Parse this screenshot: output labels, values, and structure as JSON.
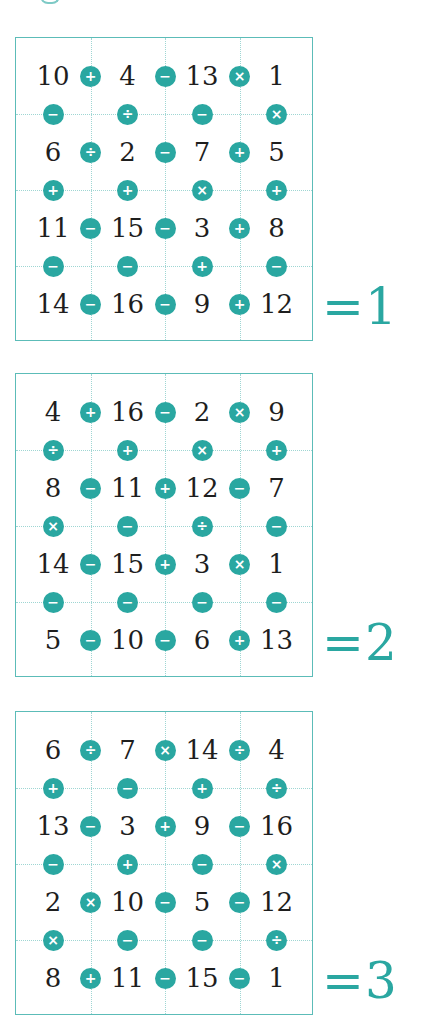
{
  "accent_color": "#2aa7a1",
  "puzzles": [
    {
      "result": "=1",
      "rows": [
        [
          "10",
          "4",
          "13",
          "1"
        ],
        [
          "6",
          "2",
          "7",
          "5"
        ],
        [
          "11",
          "15",
          "3",
          "8"
        ],
        [
          "14",
          "16",
          "9",
          "12"
        ]
      ],
      "h_ops": [
        [
          "+",
          "−",
          "×"
        ],
        [
          "÷",
          "−",
          "+"
        ],
        [
          "−",
          "−",
          "+"
        ],
        [
          "−",
          "−",
          "+"
        ]
      ],
      "v_ops": [
        [
          "−",
          "÷",
          "−",
          "×"
        ],
        [
          "+",
          "+",
          "×",
          "+"
        ],
        [
          "−",
          "−",
          "+",
          "−"
        ]
      ]
    },
    {
      "result": "=2",
      "rows": [
        [
          "4",
          "16",
          "2",
          "9"
        ],
        [
          "8",
          "11",
          "12",
          "7"
        ],
        [
          "14",
          "15",
          "3",
          "1"
        ],
        [
          "5",
          "10",
          "6",
          "13"
        ]
      ],
      "h_ops": [
        [
          "+",
          "−",
          "×"
        ],
        [
          "−",
          "+",
          "−"
        ],
        [
          "−",
          "+",
          "×"
        ],
        [
          "−",
          "−",
          "+"
        ]
      ],
      "v_ops": [
        [
          "÷",
          "+",
          "×",
          "+"
        ],
        [
          "×",
          "−",
          "÷",
          "−"
        ],
        [
          "−",
          "−",
          "−",
          "−"
        ]
      ]
    },
    {
      "result": "=3",
      "rows": [
        [
          "6",
          "7",
          "14",
          "4"
        ],
        [
          "13",
          "3",
          "9",
          "16"
        ],
        [
          "2",
          "10",
          "5",
          "12"
        ],
        [
          "8",
          "11",
          "15",
          "1"
        ]
      ],
      "h_ops": [
        [
          "÷",
          "×",
          "÷"
        ],
        [
          "−",
          "+",
          "−"
        ],
        [
          "×",
          "−",
          "−"
        ],
        [
          "+",
          "−",
          "−"
        ]
      ],
      "v_ops": [
        [
          "+",
          "−",
          "+",
          "÷"
        ],
        [
          "−",
          "+",
          "−",
          "×"
        ],
        [
          "×",
          "−",
          "−",
          "÷"
        ]
      ]
    }
  ]
}
